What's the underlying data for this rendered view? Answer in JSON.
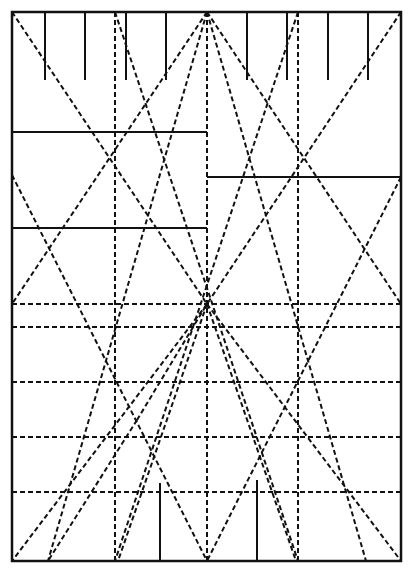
{
  "diagram": {
    "title": "",
    "type": "crease-pattern",
    "canvas": {
      "width": 412,
      "height": 576,
      "background": "#ffffff"
    },
    "frame": {
      "x1": 12,
      "y1": 12,
      "x2": 401,
      "y2": 561,
      "stroke": "#111111",
      "width": 2.5
    },
    "colors": {
      "ink": "#111111"
    },
    "solid_lines": [
      {
        "id": "top-tick-1",
        "x1": 45,
        "y1": 12,
        "x2": 45,
        "y2": 80
      },
      {
        "id": "top-tick-2",
        "x1": 85,
        "y1": 12,
        "x2": 85,
        "y2": 80
      },
      {
        "id": "top-tick-3",
        "x1": 126,
        "y1": 12,
        "x2": 126,
        "y2": 80
      },
      {
        "id": "top-tick-4",
        "x1": 166,
        "y1": 12,
        "x2": 166,
        "y2": 80
      },
      {
        "id": "top-tick-5",
        "x1": 247,
        "y1": 12,
        "x2": 247,
        "y2": 80
      },
      {
        "id": "top-tick-6",
        "x1": 287,
        "y1": 12,
        "x2": 287,
        "y2": 80
      },
      {
        "id": "top-tick-7",
        "x1": 328,
        "y1": 12,
        "x2": 328,
        "y2": 80
      },
      {
        "id": "top-tick-8",
        "x1": 368,
        "y1": 12,
        "x2": 368,
        "y2": 80
      },
      {
        "id": "left-horizontal-upper",
        "x1": 12,
        "y1": 132,
        "x2": 207,
        "y2": 132
      },
      {
        "id": "left-horizontal-lower",
        "x1": 12,
        "y1": 228,
        "x2": 207,
        "y2": 228
      },
      {
        "id": "right-horizontal",
        "x1": 207,
        "y1": 177,
        "x2": 401,
        "y2": 177
      },
      {
        "id": "bottom-tick-left",
        "x1": 160,
        "y1": 483,
        "x2": 160,
        "y2": 561
      },
      {
        "id": "bottom-tick-right",
        "x1": 257,
        "y1": 480,
        "x2": 257,
        "y2": 561
      }
    ],
    "dashed_lines": [
      {
        "id": "vertical-left-quarter",
        "x1": 115,
        "y1": 12,
        "x2": 115,
        "y2": 561
      },
      {
        "id": "vertical-center",
        "x1": 207,
        "y1": 12,
        "x2": 207,
        "y2": 561
      },
      {
        "id": "vertical-right-quarter",
        "x1": 298,
        "y1": 12,
        "x2": 298,
        "y2": 561
      },
      {
        "id": "horizontal-1",
        "x1": 12,
        "y1": 304,
        "x2": 401,
        "y2": 304
      },
      {
        "id": "horizontal-2",
        "x1": 12,
        "y1": 327,
        "x2": 401,
        "y2": 327
      },
      {
        "id": "horizontal-3",
        "x1": 12,
        "y1": 382,
        "x2": 401,
        "y2": 382
      },
      {
        "id": "horizontal-4",
        "x1": 12,
        "y1": 437,
        "x2": 401,
        "y2": 437
      },
      {
        "id": "horizontal-5",
        "x1": 12,
        "y1": 492,
        "x2": 401,
        "y2": 492
      },
      {
        "id": "diag-topleft-down",
        "x1": 12,
        "y1": 12,
        "x2": 207,
        "y2": 304
      },
      {
        "id": "diag-topright-down",
        "x1": 401,
        "y1": 12,
        "x2": 207,
        "y2": 304
      },
      {
        "id": "diag-topcenter-leftedge",
        "x1": 207,
        "y1": 12,
        "x2": 12,
        "y2": 304
      },
      {
        "id": "diag-topcenter-rightedge",
        "x1": 207,
        "y1": 12,
        "x2": 401,
        "y2": 304
      },
      {
        "id": "diag-topleftq-down",
        "x1": 115,
        "y1": 12,
        "x2": 298,
        "y2": 561
      },
      {
        "id": "diag-toprightq-down",
        "x1": 298,
        "y1": 12,
        "x2": 115,
        "y2": 561
      },
      {
        "id": "diag-topcenter-bottomleft",
        "x1": 207,
        "y1": 12,
        "x2": 48,
        "y2": 561
      },
      {
        "id": "diag-topcenter-bottomright",
        "x1": 207,
        "y1": 12,
        "x2": 366,
        "y2": 561
      },
      {
        "id": "diag-leftedge-mid",
        "x1": 12,
        "y1": 175,
        "x2": 207,
        "y2": 561
      },
      {
        "id": "diag-rightedge-mid",
        "x1": 401,
        "y1": 177,
        "x2": 207,
        "y2": 561
      },
      {
        "id": "diag-center-bottomleft",
        "x1": 207,
        "y1": 304,
        "x2": 12,
        "y2": 561
      },
      {
        "id": "diag-center-bottomright",
        "x1": 207,
        "y1": 304,
        "x2": 401,
        "y2": 561
      },
      {
        "id": "diag-midleft-bottom",
        "x1": 137,
        "y1": 420,
        "x2": 48,
        "y2": 561
      },
      {
        "id": "diag-midleft-up",
        "x1": 137,
        "y1": 420,
        "x2": 207,
        "y2": 304
      },
      {
        "id": "diag-center-to-bottomcenterleft",
        "x1": 207,
        "y1": 304,
        "x2": 118,
        "y2": 561
      },
      {
        "id": "diag-center-to-bottomcenterright",
        "x1": 207,
        "y1": 304,
        "x2": 296,
        "y2": 561
      }
    ],
    "dash": {
      "pattern": "5 3",
      "width": 2
    },
    "solid": {
      "width": 2
    }
  }
}
